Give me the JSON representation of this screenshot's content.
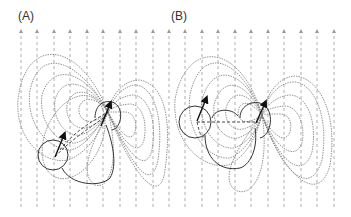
{
  "panels": [
    {
      "label": "(A)",
      "description": "Dipole field lines with uniform vertical field, two dipole sources"
    },
    {
      "label": "(B)",
      "description": "Dipole field lines with uniform vertical field, two dipole sources (shifted configuration)"
    }
  ],
  "field_lines": {
    "count": 20,
    "color": "#9a9a9a",
    "style": "dashed",
    "direction": "up"
  },
  "colors": {
    "contour": "#7a7a7a",
    "solid": "#333333",
    "arrow": "#111111"
  }
}
